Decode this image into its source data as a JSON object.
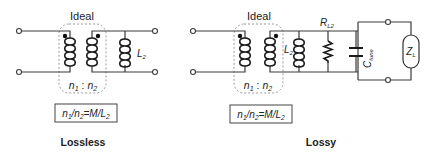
{
  "diagrams": [
    {
      "id": "lossless",
      "caption": "Lossless",
      "transformer_label": "Ideal",
      "turns_ratio": {
        "n1": "n",
        "n1_sub": "1",
        "sep": " : ",
        "n2": "n",
        "n2_sub": "2"
      },
      "formula": {
        "a": "n",
        "a_sub": "1",
        "slash": "/",
        "b": "n",
        "b_sub": "2",
        "eq": "=M/L",
        "c_sub": "2"
      },
      "components": [
        {
          "type": "inductor",
          "label": "L",
          "sub": "2"
        }
      ]
    },
    {
      "id": "lossy",
      "caption": "Lossy",
      "transformer_label": "Ideal",
      "turns_ratio": {
        "n1": "n",
        "n1_sub": "1",
        "sep": " : ",
        "n2": "n",
        "n2_sub": "2"
      },
      "formula": {
        "a": "n",
        "a_sub": "1",
        "slash": "/",
        "b": "n",
        "b_sub": "2",
        "eq": "=M/L",
        "c_sub": "2"
      },
      "components": [
        {
          "type": "inductor",
          "label": "L",
          "sub": "2"
        },
        {
          "type": "resistor",
          "label": "R",
          "sub": "L2"
        },
        {
          "type": "capacitor",
          "label": "C",
          "sub": "tune"
        },
        {
          "type": "load",
          "label": "Z",
          "sub": "L"
        }
      ]
    }
  ]
}
